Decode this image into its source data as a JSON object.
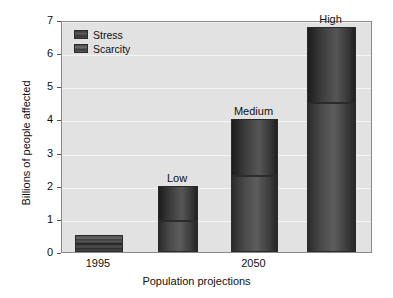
{
  "chart_data": {
    "type": "bar",
    "title": "",
    "xlabel": "Population projections",
    "ylabel": "Billions of people affected",
    "ylim": [
      0,
      7
    ],
    "yticks": [
      0,
      1,
      2,
      3,
      4,
      5,
      6,
      7
    ],
    "grid": true,
    "stacked": true,
    "legend_position": "top-left",
    "categories": [
      "1995",
      "Low",
      "Medium",
      "High"
    ],
    "xtick_labels": [
      "1995",
      "2050"
    ],
    "bar_labels": [
      "",
      "Low",
      "Medium",
      "High"
    ],
    "series": [
      {
        "name": "Scarcity",
        "values": [
          0.25,
          0.95,
          2.3,
          4.5
        ]
      },
      {
        "name": "Stress",
        "values": [
          0.25,
          1.05,
          1.7,
          2.3
        ]
      }
    ],
    "totals": [
      0.5,
      2.0,
      4.0,
      6.8
    ],
    "colors": {
      "plot_background": "#e2e2e2",
      "gridline": "#f4f4f4",
      "bar_outline": "#2b2b2b",
      "stress": "#3d3d3d",
      "scarcity": "#555555",
      "text": "#101010",
      "axis": "#8a8a8a"
    }
  },
  "legend": {
    "items": [
      {
        "label": "Stress"
      },
      {
        "label": "Scarcity"
      }
    ]
  },
  "axes": {
    "y_title": "Billions of people affected",
    "x_title": "Population projections",
    "y_ticks": [
      "0",
      "1",
      "2",
      "3",
      "4",
      "5",
      "6",
      "7"
    ],
    "x_ticks": [
      "1995",
      "2050"
    ]
  }
}
